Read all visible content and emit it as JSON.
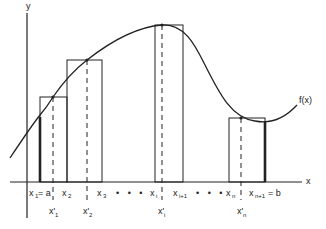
{
  "diagram": {
    "axes": {
      "x_label": "x",
      "y_label": "y"
    },
    "curve_label": "f(x)",
    "partition_labels": [
      {
        "base": "x",
        "sub": "1",
        "suffix": " = a"
      },
      {
        "base": "x",
        "sub": "2",
        "suffix": ""
      },
      {
        "base": "x",
        "sub": "3",
        "suffix": ""
      },
      {
        "base": "x",
        "sub": "i",
        "suffix": ""
      },
      {
        "base": "x",
        "sub": "i+1",
        "suffix": ""
      },
      {
        "base": "x",
        "sub": "n",
        "suffix": ""
      },
      {
        "base": "x",
        "sub": "n+1",
        "suffix": " = b"
      }
    ],
    "sample_labels": [
      {
        "base": "x'",
        "sub": "1"
      },
      {
        "base": "x'",
        "sub": "2"
      },
      {
        "base": "x'",
        "sub": "i"
      },
      {
        "base": "x'",
        "sub": "n"
      }
    ],
    "ellipsis": "• • •",
    "rectangles": [
      {
        "name": "rect-1",
        "left": "x1",
        "right": "x2",
        "sample": "x'1"
      },
      {
        "name": "rect-2",
        "left": "x2",
        "right": "x3",
        "sample": "x'2"
      },
      {
        "name": "rect-i",
        "left": "xi",
        "right": "xi+1",
        "sample": "x'i"
      },
      {
        "name": "rect-n",
        "left": "xn",
        "right": "xn+1",
        "sample": "x'n"
      }
    ],
    "colors": {
      "ink": "#222222",
      "background": "#ffffff"
    }
  }
}
